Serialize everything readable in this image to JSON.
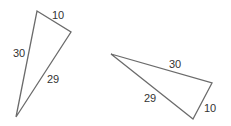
{
  "triangles": [
    {
      "name": "left-triangle",
      "labels": {
        "top": "10",
        "left": "30",
        "hyp": "29"
      }
    },
    {
      "name": "right-triangle",
      "labels": {
        "top": "30",
        "hyp": "29",
        "short": "10"
      }
    }
  ],
  "colors": {
    "stroke": "#6b6b6b",
    "text": "#333333"
  }
}
